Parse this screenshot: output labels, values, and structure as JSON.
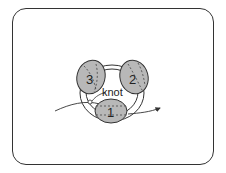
{
  "diagram": {
    "label_knot": "knot",
    "lobes": [
      {
        "id": "1",
        "label": "1"
      },
      {
        "id": "2",
        "label": "2"
      },
      {
        "id": "3",
        "label": "3"
      }
    ],
    "colors": {
      "lobe_fill": "#b8b8b8",
      "stroke": "#333333",
      "background": "#ffffff"
    }
  }
}
